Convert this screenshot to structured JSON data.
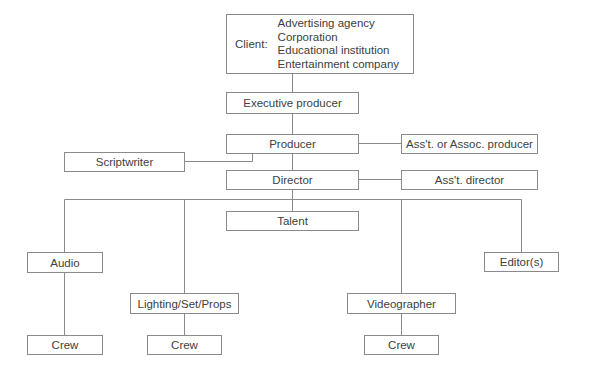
{
  "diagram": {
    "type": "organizational-chart",
    "client": {
      "label": "Client:",
      "types": [
        "Advertising agency",
        "Corporation",
        "Educational institution",
        "Entertainment company"
      ]
    },
    "nodes": {
      "executive_producer": "Executive producer",
      "producer": "Producer",
      "scriptwriter": "Scriptwriter",
      "assoc_producer": "Ass't. or Assoc. producer",
      "director": "Director",
      "asst_director": "Ass't. director",
      "talent": "Talent",
      "audio": "Audio",
      "audio_crew": "Crew",
      "lighting": "Lighting/Set/Props",
      "lighting_crew": "Crew",
      "videographer": "Videographer",
      "videographer_crew": "Crew",
      "editors": "Editor(s)"
    },
    "edges": [
      [
        "client",
        "executive_producer"
      ],
      [
        "executive_producer",
        "producer"
      ],
      [
        "producer",
        "scriptwriter"
      ],
      [
        "producer",
        "assoc_producer"
      ],
      [
        "producer",
        "director"
      ],
      [
        "director",
        "asst_director"
      ],
      [
        "director",
        "talent"
      ],
      [
        "director",
        "audio"
      ],
      [
        "director",
        "lighting"
      ],
      [
        "director",
        "videographer"
      ],
      [
        "director",
        "editors"
      ],
      [
        "audio",
        "audio_crew"
      ],
      [
        "lighting",
        "lighting_crew"
      ],
      [
        "videographer",
        "videographer_crew"
      ]
    ],
    "colors": {
      "line": "#8a8a8a",
      "text": "#404040",
      "background": "#ffffff"
    }
  }
}
